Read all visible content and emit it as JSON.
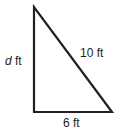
{
  "diagram": {
    "type": "right-triangle",
    "stroke_color": "#231f20",
    "vertices": {
      "top": [
        34,
        7
      ],
      "right_angle": [
        34,
        112
      ],
      "bottom_right": [
        112,
        112
      ]
    },
    "labels": {
      "vertical_side_var": "d",
      "vertical_side_unit": " ft",
      "hypotenuse": "10 ft",
      "base": "6 ft"
    }
  }
}
